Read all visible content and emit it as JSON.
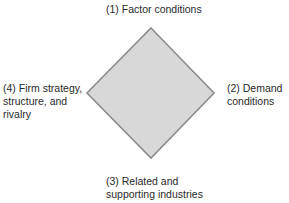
{
  "diagram": {
    "shape": "diamond",
    "colors": {
      "fill": "#d8d8d8",
      "stroke": "#8c8c8c",
      "text": "#2a2a2a"
    },
    "vertices": {
      "top": [
        151,
        28
      ],
      "right": [
        214,
        93
      ],
      "bottom": [
        151,
        158
      ],
      "left": [
        87,
        93
      ]
    },
    "labels": {
      "top": {
        "lines": [
          "(1) Factor conditions"
        ]
      },
      "right": {
        "lines": [
          "(2) Demand",
          "conditions"
        ]
      },
      "bottom": {
        "lines": [
          "(3) Related and",
          "supporting industries"
        ]
      },
      "left": {
        "lines": [
          "(4) Firm strategy,",
          "structure, and",
          "rivalry"
        ]
      }
    }
  }
}
